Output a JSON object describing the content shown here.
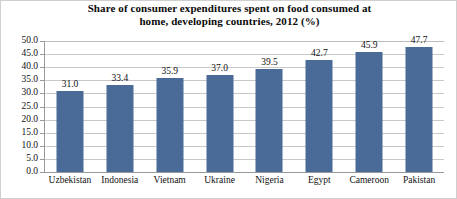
{
  "chart_data": {
    "type": "bar",
    "title": "Share of consumer expenditures spent on food consumed at home, developing countries, 2012 (%)",
    "title_lines": [
      "Share of consumer expenditures spent on food consumed at",
      "home, developing countries, 2012 (%)"
    ],
    "categories": [
      "Uzbekistan",
      "Indonesia",
      "Vietnam",
      "Ukraine",
      "Nigeria",
      "Egypt",
      "Cameroon",
      "Pakistan"
    ],
    "values": [
      31.0,
      33.4,
      35.9,
      37.0,
      39.5,
      42.7,
      45.9,
      47.7
    ],
    "value_labels": [
      "31.0",
      "33.4",
      "35.9",
      "37.0",
      "39.5",
      "42.7",
      "45.9",
      "47.7"
    ],
    "xlabel": "",
    "ylabel": "",
    "ylim": [
      0.0,
      50.0
    ],
    "ytick_step": 5.0,
    "ytick_labels": [
      "50.0",
      "45.0",
      "40.0",
      "35.0",
      "30.0",
      "25.0",
      "20.0",
      "15.0",
      "10.0",
      "5.0",
      "0.0"
    ],
    "ytick_values": [
      50.0,
      45.0,
      40.0,
      35.0,
      30.0,
      25.0,
      20.0,
      15.0,
      10.0,
      5.0,
      0.0
    ],
    "grid": true,
    "grid_orientation": "horizontal",
    "legend": false,
    "legend_position": "none",
    "series": [
      {
        "name": "Share of consumer expenditures on food at home",
        "color": "#4A6A98",
        "values": [
          31.0,
          33.4,
          35.9,
          37.0,
          39.5,
          42.7,
          45.9,
          47.7
        ]
      }
    ]
  },
  "colors": {
    "bar": "#4A6A98",
    "gridline": "#C8C8C8",
    "axis": "#9A9A9A",
    "text": "#111111",
    "background": "#FFFFFF",
    "frame": "#CFCFCF"
  }
}
